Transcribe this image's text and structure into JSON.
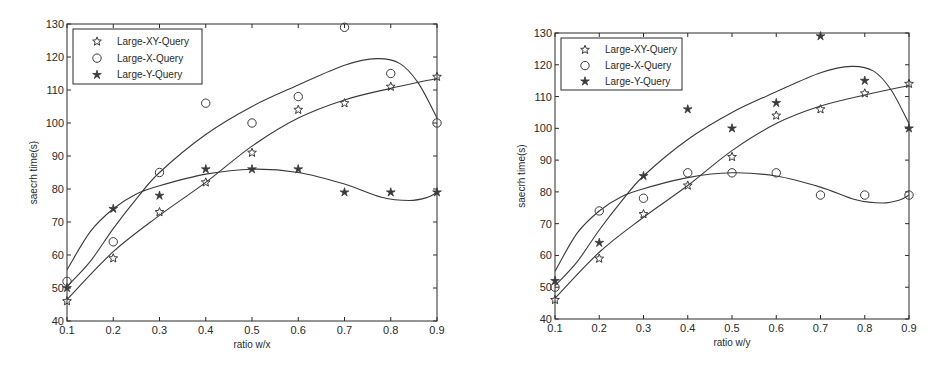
{
  "chart_data": [
    {
      "type": "scatter",
      "title": "",
      "xlabel": "ratio w/x",
      "ylabel": "saecrh time(s)",
      "xlim": [
        0.1,
        0.9
      ],
      "ylim": [
        40,
        130
      ],
      "xticks": [
        0.1,
        0.2,
        0.3,
        0.4,
        0.5,
        0.6,
        0.7,
        0.8,
        0.9
      ],
      "xtick_labels": [
        "0.1",
        "0.2",
        "0.3",
        "0.4",
        "0.5",
        "0.6",
        "0.7",
        "0.8",
        "0.9"
      ],
      "yticks": [
        40,
        50,
        60,
        70,
        80,
        90,
        100,
        110,
        120,
        130
      ],
      "ytick_labels": [
        "40",
        "50",
        "60",
        "70",
        "80",
        "90",
        "100",
        "110",
        "120",
        "130"
      ],
      "grid": false,
      "legend_position": "upper left",
      "x": [
        0.1,
        0.2,
        0.3,
        0.4,
        0.5,
        0.6,
        0.7,
        0.8,
        0.9
      ],
      "series": [
        {
          "name": "Large-XY-Query",
          "marker": "star",
          "values": [
            46,
            59,
            73,
            82,
            91,
            104,
            106,
            111,
            114
          ],
          "fit_curve": [
            [
              0.1,
              46.5
            ],
            [
              0.2,
              61
            ],
            [
              0.3,
              72
            ],
            [
              0.4,
              82
            ],
            [
              0.5,
              93
            ],
            [
              0.6,
              101.5
            ],
            [
              0.7,
              107
            ],
            [
              0.8,
              110.5
            ],
            [
              0.9,
              113.5
            ]
          ]
        },
        {
          "name": "Large-X-Query",
          "marker": "circle",
          "values": [
            52,
            64,
            85,
            106,
            100,
            108,
            129,
            115,
            100
          ],
          "fit_curve": [
            [
              0.1,
              50.5
            ],
            [
              0.15,
              58
            ],
            [
              0.2,
              68
            ],
            [
              0.25,
              77
            ],
            [
              0.3,
              85
            ],
            [
              0.4,
              96.5
            ],
            [
              0.5,
              105
            ],
            [
              0.6,
              111.5
            ],
            [
              0.7,
              117.5
            ],
            [
              0.77,
              119.5
            ],
            [
              0.82,
              118
            ],
            [
              0.86,
              112
            ],
            [
              0.9,
              101.5
            ]
          ]
        },
        {
          "name": "Large-Y-Query",
          "marker": "filled-star",
          "values": [
            50,
            74,
            78,
            86,
            86,
            86,
            79,
            79,
            79
          ],
          "fit_curve": [
            [
              0.1,
              55.5
            ],
            [
              0.15,
              67
            ],
            [
              0.2,
              74
            ],
            [
              0.25,
              78.5
            ],
            [
              0.3,
              81
            ],
            [
              0.4,
              84.5
            ],
            [
              0.5,
              86
            ],
            [
              0.6,
              85
            ],
            [
              0.7,
              81.5
            ],
            [
              0.78,
              77.5
            ],
            [
              0.84,
              76.5
            ],
            [
              0.88,
              77.5
            ],
            [
              0.9,
              79
            ]
          ]
        }
      ],
      "layout": {
        "plot_left": 67,
        "plot_right": 437,
        "plot_top": 24,
        "plot_bottom": 321,
        "legend_box": [
          73,
          29,
          202,
          84
        ]
      }
    },
    {
      "type": "scatter",
      "title": "",
      "xlabel": "ratio w/y",
      "ylabel": "saecrh time(s)",
      "xlim": [
        0.1,
        0.9
      ],
      "ylim": [
        40,
        130
      ],
      "xticks": [
        0.1,
        0.2,
        0.3,
        0.4,
        0.5,
        0.6,
        0.7,
        0.8,
        0.9
      ],
      "xtick_labels": [
        "0.1",
        "0.2",
        "0.3",
        "0.4",
        "0.5",
        "0.6",
        "0.7",
        "0.8",
        "0.9"
      ],
      "yticks": [
        40,
        50,
        60,
        70,
        80,
        90,
        100,
        110,
        120,
        130
      ],
      "ytick_labels": [
        "40",
        "50",
        "60",
        "70",
        "80",
        "90",
        "100",
        "110",
        "120",
        "130"
      ],
      "grid": false,
      "legend_position": "upper left",
      "x": [
        0.1,
        0.2,
        0.3,
        0.4,
        0.5,
        0.6,
        0.7,
        0.8,
        0.9
      ],
      "series": [
        {
          "name": "Large-XY-Query",
          "marker": "star",
          "values": [
            46,
            59,
            73,
            82,
            91,
            104,
            106,
            111,
            114
          ],
          "fit_curve": [
            [
              0.1,
              46.5
            ],
            [
              0.2,
              61
            ],
            [
              0.3,
              72
            ],
            [
              0.4,
              82
            ],
            [
              0.5,
              93
            ],
            [
              0.6,
              101.5
            ],
            [
              0.7,
              107
            ],
            [
              0.8,
              110.5
            ],
            [
              0.9,
              113.5
            ]
          ]
        },
        {
          "name": "Large-X-Query",
          "marker": "circle",
          "values": [
            50,
            74,
            78,
            86,
            86,
            86,
            79,
            79,
            79
          ],
          "fit_curve": [
            [
              0.1,
              55
            ],
            [
              0.15,
              67
            ],
            [
              0.2,
              74
            ],
            [
              0.25,
              78.5
            ],
            [
              0.3,
              81
            ],
            [
              0.4,
              84.5
            ],
            [
              0.5,
              86
            ],
            [
              0.6,
              85
            ],
            [
              0.7,
              81.5
            ],
            [
              0.78,
              77.5
            ],
            [
              0.84,
              76.5
            ],
            [
              0.88,
              77.5
            ],
            [
              0.9,
              79
            ]
          ]
        },
        {
          "name": "Large-Y-Query",
          "marker": "filled-star",
          "values": [
            52,
            64,
            85,
            106,
            100,
            108,
            129,
            115,
            100
          ],
          "fit_curve": [
            [
              0.1,
              50.5
            ],
            [
              0.15,
              58
            ],
            [
              0.2,
              68
            ],
            [
              0.25,
              77
            ],
            [
              0.3,
              85
            ],
            [
              0.4,
              96.5
            ],
            [
              0.5,
              105
            ],
            [
              0.6,
              111.5
            ],
            [
              0.7,
              117.5
            ],
            [
              0.77,
              119.5
            ],
            [
              0.82,
              118
            ],
            [
              0.86,
              112
            ],
            [
              0.9,
              101.5
            ]
          ]
        }
      ],
      "layout": {
        "plot_left": 555,
        "plot_right": 909,
        "plot_top": 33,
        "plot_bottom": 319,
        "legend_box": [
          561,
          38,
          682,
          90
        ]
      }
    }
  ],
  "style": {
    "line_color": "#3a3a3a",
    "axis_color": "#2a2a2a",
    "background": "#ffffff"
  }
}
